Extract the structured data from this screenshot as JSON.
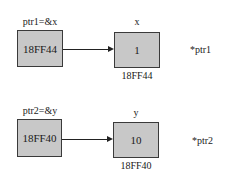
{
  "diagram": {
    "rows": [
      {
        "pointer": {
          "label": "ptr1=&x",
          "value": "18FF44"
        },
        "target": {
          "name": "x",
          "value": "1",
          "address": "18FF44"
        },
        "deref_label": "*ptr1"
      },
      {
        "pointer": {
          "label": "ptr2=&y",
          "value": "18FF40"
        },
        "target": {
          "name": "y",
          "value": "10",
          "address": "18FF40"
        },
        "deref_label": "*ptr2"
      }
    ],
    "colors": {
      "box_fill": "#c8c8c8",
      "box_border": "#3a3a3a",
      "arrow": "#222222"
    }
  }
}
